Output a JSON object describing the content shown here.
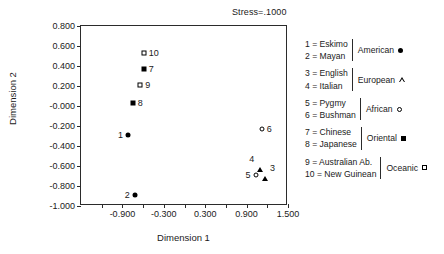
{
  "annotation": {
    "stress": "Stress=.1000"
  },
  "axes": {
    "xlabel": "Dimension 1",
    "ylabel": "Dimension 2",
    "xticks": [
      "-0.900",
      "-0.300",
      "0.300",
      "0.900",
      "1.500"
    ],
    "xtick_values": [
      -0.9,
      -0.3,
      0.3,
      0.9,
      1.5
    ],
    "xminor_values": [
      -1.2,
      -0.6,
      0.0,
      0.6,
      1.2
    ],
    "yticks": [
      "0.800",
      "0.600",
      "0.400",
      "0.200",
      "-0.000",
      "-0.200",
      "-0.400",
      "-0.600",
      "-0.800",
      "-1.000"
    ],
    "ytick_values": [
      0.8,
      0.6,
      0.4,
      0.2,
      0.0,
      -0.2,
      -0.4,
      -0.6,
      -0.8,
      -1.0
    ],
    "xlim": [
      -1.5,
      1.5
    ],
    "ylim": [
      -1.0,
      0.8
    ]
  },
  "chart_data": {
    "type": "scatter",
    "title": "",
    "subtitle": "",
    "xlabel": "Dimension 1",
    "ylabel": "Dimension 2",
    "xlim": [
      -1.5,
      1.5
    ],
    "ylim": [
      -1.0,
      0.8
    ],
    "grid": false,
    "legend_position": "right",
    "annotations": [
      "Stress=.1000"
    ],
    "points": [
      {
        "id": "1",
        "label": "1",
        "name": "Eskimo",
        "group": "American",
        "marker": "filled-circle",
        "label_side": "left",
        "x": -0.82,
        "y": -0.29
      },
      {
        "id": "2",
        "label": "2",
        "name": "Mayan",
        "group": "American",
        "marker": "filled-circle",
        "label_side": "left",
        "x": -0.72,
        "y": -0.89
      },
      {
        "id": "3",
        "label": "3",
        "name": "English",
        "group": "European",
        "marker": "open-triangle",
        "label_side": "right",
        "x": 1.16,
        "y": -0.62
      },
      {
        "id": "4",
        "label": "4",
        "name": "Italian",
        "group": "European",
        "marker": "open-triangle",
        "label_side": "left",
        "x": 1.09,
        "y": -0.53
      },
      {
        "id": "5",
        "label": "5",
        "name": "Pygmy",
        "group": "African",
        "marker": "open-circle",
        "label_side": "left",
        "x": 1.03,
        "y": -0.69
      },
      {
        "id": "6",
        "label": "6",
        "name": "Bushman",
        "group": "African",
        "marker": "open-circle",
        "label_side": "right",
        "x": 1.12,
        "y": -0.23
      },
      {
        "id": "7",
        "label": "7",
        "name": "Chinese",
        "group": "Oriental",
        "marker": "filled-square",
        "label_side": "right",
        "x": -0.59,
        "y": 0.37
      },
      {
        "id": "8",
        "label": "8",
        "name": "Japanese",
        "group": "Oriental",
        "marker": "filled-square",
        "label_side": "right",
        "x": -0.75,
        "y": 0.03
      },
      {
        "id": "9",
        "label": "9",
        "name": "Australian Ab.",
        "group": "Oceanic",
        "marker": "open-square",
        "label_side": "right",
        "x": -0.64,
        "y": 0.21
      },
      {
        "id": "10",
        "label": "10",
        "name": "New Guinean",
        "group": "Oceanic",
        "marker": "open-square",
        "label_side": "right",
        "x": -0.59,
        "y": 0.53
      }
    ],
    "series": [
      {
        "name": "American",
        "marker": "filled-circle",
        "members": [
          "1 = Eskimo",
          "2 = Mayan"
        ]
      },
      {
        "name": "European",
        "marker": "open-triangle",
        "members": [
          "3 = English",
          "4 = Italian"
        ]
      },
      {
        "name": "African",
        "marker": "open-circle",
        "members": [
          "5 = Pygmy",
          "6 = Bushman"
        ]
      },
      {
        "name": "Oriental",
        "marker": "filled-square",
        "members": [
          "7 = Chinese",
          "8 = Japanese"
        ]
      },
      {
        "name": "Oceanic",
        "marker": "open-square",
        "members": [
          "9 = Australian Ab.",
          "10 = New Guinean"
        ]
      }
    ]
  },
  "legend": {
    "groups": [
      {
        "name": "American",
        "marker": "filled-circle",
        "keys": [
          "1 = Eskimo",
          "2 = Mayan"
        ]
      },
      {
        "name": "European",
        "marker": "open-triangle",
        "keys": [
          "3 = English",
          "4 = Italian"
        ]
      },
      {
        "name": "African",
        "marker": "open-circle",
        "keys": [
          "5 = Pygmy",
          "6 = Bushman"
        ]
      },
      {
        "name": "Oriental",
        "marker": "filled-square",
        "keys": [
          "7 = Chinese",
          "8 = Japanese"
        ]
      },
      {
        "name": "Oceanic",
        "marker": "open-square",
        "keys": [
          "9 = Australian Ab.",
          "10 = New Guinean"
        ]
      }
    ]
  },
  "colors": {
    "foreground": "#000000",
    "axis": "#2b2b2b",
    "background": "#ffffff"
  }
}
